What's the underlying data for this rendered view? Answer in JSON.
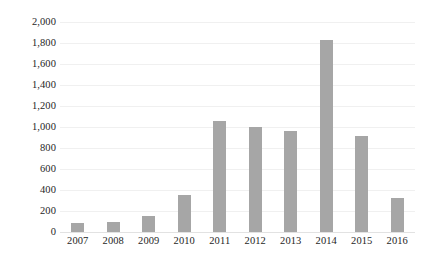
{
  "chart_data": {
    "type": "bar",
    "title": "",
    "subtitle": "",
    "xlabel": "",
    "ylabel": "",
    "categories": [
      "2007",
      "2008",
      "2009",
      "2010",
      "2011",
      "2012",
      "2013",
      "2014",
      "2015",
      "2016"
    ],
    "values": [
      90,
      100,
      150,
      350,
      1060,
      1000,
      965,
      1830,
      915,
      325
    ],
    "series": [
      {
        "name": "",
        "values": [
          90,
          100,
          150,
          350,
          1060,
          1000,
          965,
          1830,
          915,
          325
        ]
      }
    ],
    "ylim": [
      0,
      2000
    ],
    "y_ticks": [
      0,
      200,
      400,
      600,
      800,
      1000,
      1200,
      1400,
      1600,
      1800,
      2000
    ],
    "y_tick_labels": [
      "0",
      "200",
      "400",
      "600",
      "800",
      "1,000",
      "1,200",
      "1,400",
      "1,600",
      "1,800",
      "2,000"
    ],
    "grid": true,
    "grid_axis": "y",
    "legend": false,
    "legend_position": "none",
    "bar_color": "#a6a6a6",
    "gridline_color": "#f0f0f0",
    "axis_line_color": "#e2e2e2",
    "text_color": "#262626",
    "background_color": "#ffffff",
    "annotations": []
  }
}
